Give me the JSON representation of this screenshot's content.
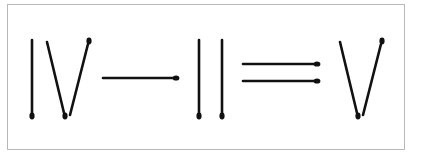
{
  "puzzle": {
    "type": "matchstick-equation",
    "equation_text": "IV - II = V",
    "colors": {
      "match_stick": "#111111",
      "match_head": "#111111",
      "frame_border": "#b8b8b8",
      "background": "#ffffff"
    },
    "symbols": [
      {
        "symbol": "IV",
        "role": "roman-numeral",
        "match_count": 3
      },
      {
        "symbol": "-",
        "role": "minus-sign",
        "match_count": 1
      },
      {
        "symbol": "II",
        "role": "roman-numeral",
        "match_count": 2
      },
      {
        "symbol": "=",
        "role": "equals-sign",
        "match_count": 2
      },
      {
        "symbol": "V",
        "role": "roman-numeral",
        "match_count": 2
      }
    ],
    "total_matches": 10
  }
}
